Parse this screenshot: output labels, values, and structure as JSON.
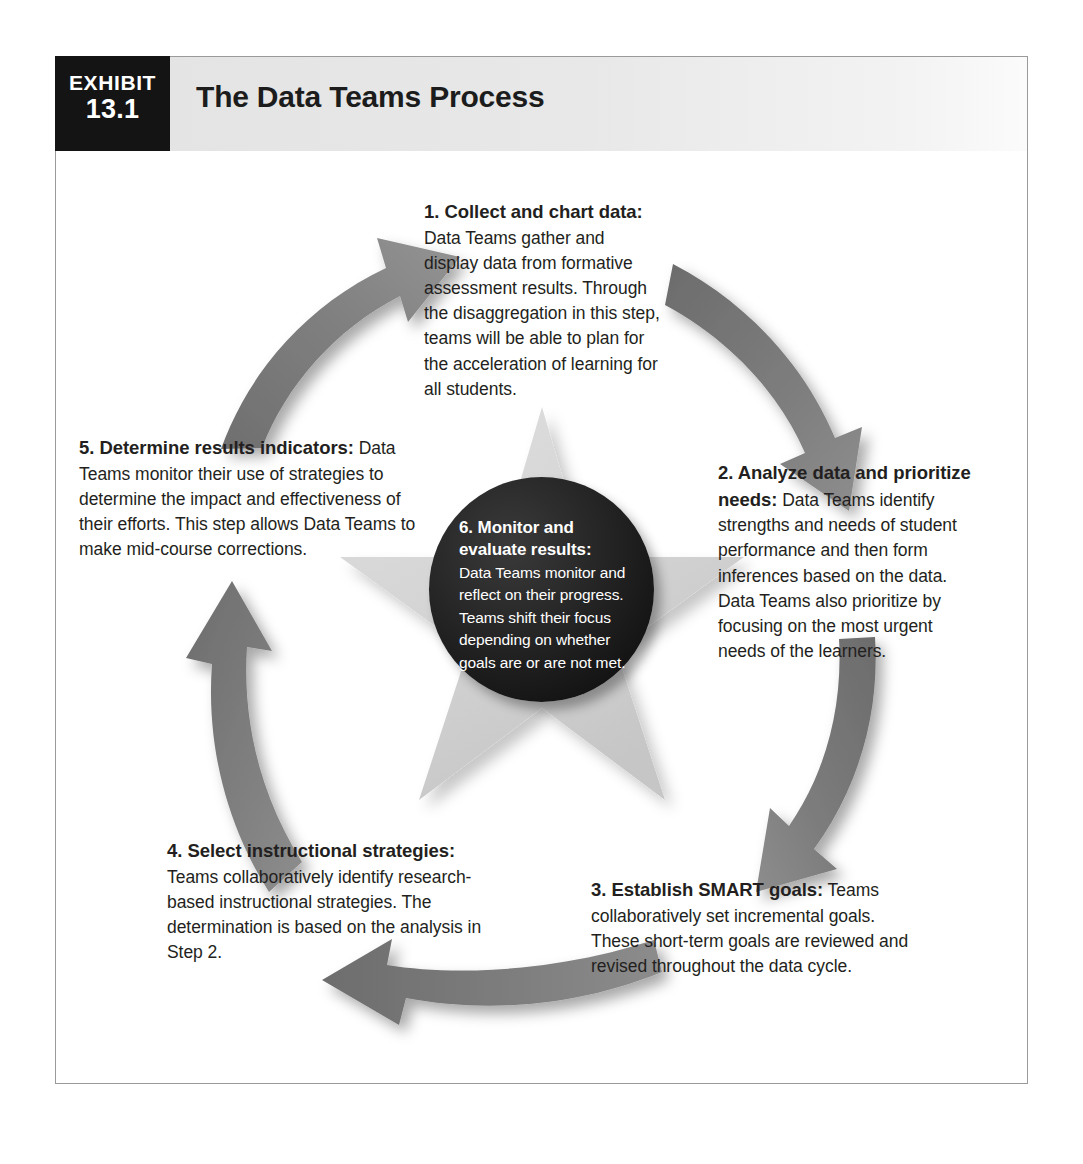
{
  "exhibit": {
    "badge_word": "EXHIBIT",
    "badge_number": "13.1",
    "title": "The Data Teams Process"
  },
  "colors": {
    "badge_background": "#141414",
    "header_background": "#e4e4e4",
    "frame_border": "#9a9a9a",
    "arrow_gray": "#7d7d7d",
    "star_gray": "#d4d4d4",
    "circle_black": "#141414",
    "text": "#231f20",
    "circle_text": "#ffffff"
  },
  "diagram": {
    "type": "cyclical-process-diagram",
    "shape": "clockwise-cycle-with-center-star",
    "arrow_count": 5,
    "arrows": [
      {
        "name": "arrow-step4-to-step5",
        "direction": "up-left"
      },
      {
        "name": "arrow-step5-to-step1",
        "direction": "up-right"
      },
      {
        "name": "arrow-step1-to-step2",
        "direction": "down-right"
      },
      {
        "name": "arrow-step2-to-step3",
        "direction": "down-left"
      },
      {
        "name": "arrow-step3-to-step4",
        "direction": "left"
      }
    ],
    "center_star_label": "five-pointed-star",
    "steps": [
      {
        "id": "step-1",
        "number": "1.",
        "heading": "1. Collect and chart data:",
        "body": " Data Teams gather and display data from formative assessment results. Through the disaggregation in this step, teams will be able to plan for the acceleration of learning for all students."
      },
      {
        "id": "step-2",
        "number": "2.",
        "heading": "2. Analyze data and prioritize needs:",
        "body": " Data Teams identify strengths and needs of student performance and then form inferences based on the data. Data Teams also prioritize by focusing on the most urgent needs of the learners."
      },
      {
        "id": "step-3",
        "number": "3.",
        "heading": "3. Establish SMART goals:",
        "body": " Teams collaboratively set incremental goals. These short-term goals are reviewed and revised throughout the data cycle."
      },
      {
        "id": "step-4",
        "number": "4.",
        "heading": "4. Select instructional strategies:",
        "body": " Teams collaboratively identify research-based instructional strategies. The determination is based on the analysis in Step 2."
      },
      {
        "id": "step-5",
        "number": "5.",
        "heading": "5. Determine results indicators:",
        "body": " Data Teams monitor their use of strategies to determine the impact and effectiveness of their efforts. This step allows Data Teams to make mid-course corrections."
      },
      {
        "id": "step-6",
        "number": "6.",
        "heading": "6. Monitor and evaluate results:",
        "body": " Data Teams monitor and reflect on their progress. Teams shift their focus depending on whether goals are or are not met."
      }
    ]
  }
}
